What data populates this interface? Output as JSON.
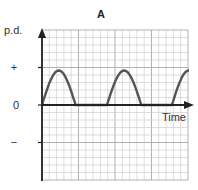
{
  "chart_data": {
    "type": "line",
    "title": "A",
    "xlabel": "Time",
    "ylabel": "p.d.",
    "y_tick_labels": [
      "+",
      "0",
      "−"
    ],
    "grid": true,
    "grid_cells": {
      "x": 20,
      "y": 20,
      "major_every": 5
    },
    "waveform": "half-wave rectified sinusoid",
    "series": [
      {
        "name": "p.d.",
        "description": "positive half-cycles separated by zero intervals",
        "humps": [
          {
            "start_cell": 0.0,
            "peak_cell": 2.3,
            "end_cell": 4.6,
            "peak_value_cells": 4.6
          },
          {
            "start_cell": 8.9,
            "peak_cell": 11.2,
            "end_cell": 13.6,
            "peak_value_cells": 4.6
          },
          {
            "start_cell": 17.8,
            "peak_cell": 20.1,
            "end_cell": 22.4,
            "peak_value_cells": 4.6
          }
        ]
      }
    ],
    "ylim_cells": [
      -10,
      10
    ],
    "xlim_cells": [
      0,
      20
    ]
  },
  "geometry": {
    "x0": 42,
    "x1": 188,
    "y0": 30,
    "y1": 180,
    "zero_y": 105,
    "cell_x": 7.3,
    "cell_y": 7.5
  }
}
